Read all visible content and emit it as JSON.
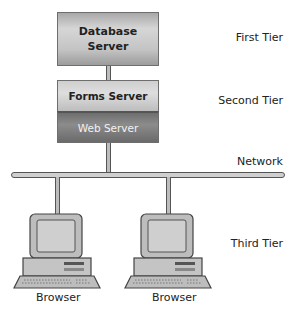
{
  "diagram": {
    "servers": {
      "database": "Database\nServer",
      "forms": "Forms Server",
      "web": "Web Server"
    },
    "tiers": {
      "first": "First Tier",
      "second": "Second Tier",
      "network": "Network",
      "third": "Third Tier"
    },
    "clients": [
      {
        "label": "Browser"
      },
      {
        "label": "Browser"
      }
    ]
  }
}
